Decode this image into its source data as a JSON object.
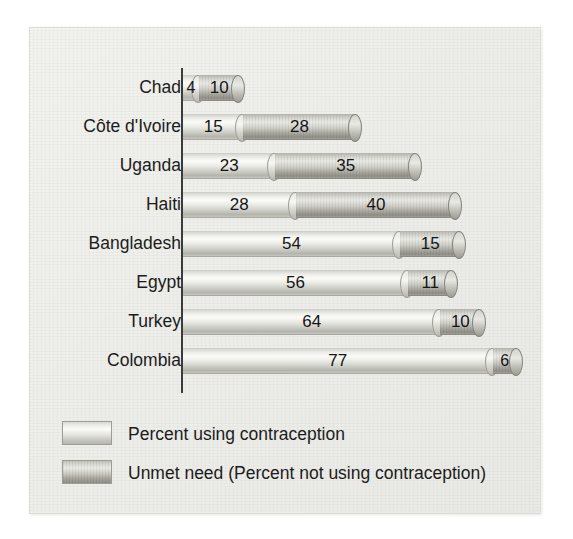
{
  "chart_data": {
    "type": "bar",
    "orientation": "horizontal",
    "stacked": true,
    "title": "",
    "xlabel": "",
    "ylabel": "",
    "grid": false,
    "legend_position": "bottom-left",
    "xlim": [
      0,
      90
    ],
    "categories": [
      "Chad",
      "Côte d'Ivoire",
      "Uganda",
      "Haiti",
      "Bangladesh",
      "Egypt",
      "Turkey",
      "Colombia"
    ],
    "series": [
      {
        "name": "Percent using contraception",
        "values": [
          4,
          15,
          23,
          28,
          54,
          56,
          64,
          77
        ]
      },
      {
        "name": "Unmet need (Percent not using contraception)",
        "values": [
          10,
          28,
          35,
          40,
          15,
          11,
          10,
          6
        ]
      }
    ],
    "totals": [
      14,
      43,
      58,
      68,
      69,
      67,
      74,
      83
    ]
  },
  "legend": {
    "items": [
      {
        "label": "Percent using contraception",
        "swatch": "light-cylinder-swatch"
      },
      {
        "label": "Unmet need (Percent not using contraception)",
        "swatch": "dark-cylinder-swatch"
      }
    ]
  },
  "colors": {
    "series_a_light": "#fbfbf8",
    "series_a_dark": "#b4b4ad",
    "series_b_light": "#eaeae5",
    "series_b_dark": "#8f8f88",
    "axis": "#3b3b3b",
    "text": "#1c1c1c",
    "panel": "#eeeeea"
  }
}
